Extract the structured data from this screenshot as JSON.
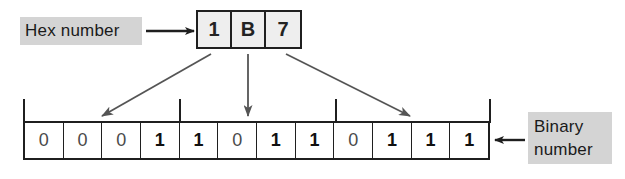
{
  "diagram": {
    "hex_label": "Hex number",
    "binary_label_line1": "Binary",
    "binary_label_line2": "number",
    "hex_digits": [
      "1",
      "B",
      "7"
    ],
    "binary_bits": [
      "0",
      "0",
      "0",
      "1",
      "1",
      "0",
      "1",
      "1",
      "0",
      "1",
      "1",
      "1"
    ],
    "nibble_groups": [
      {
        "hex": "1",
        "bits": [
          "0",
          "0",
          "0",
          "1"
        ]
      },
      {
        "hex": "B",
        "bits": [
          "1",
          "0",
          "1",
          "1"
        ]
      },
      {
        "hex": "7",
        "bits": [
          "0",
          "1",
          "1",
          "1"
        ]
      }
    ],
    "arrows": [
      {
        "name": "hex-label-to-hex-box",
        "direction": "right"
      },
      {
        "name": "hex-1-to-nibble-1",
        "direction": "down-left"
      },
      {
        "name": "hex-b-to-nibble-2",
        "direction": "down"
      },
      {
        "name": "hex-7-to-nibble-3",
        "direction": "down-right"
      },
      {
        "name": "binary-label-to-binary-row",
        "direction": "left"
      }
    ],
    "colors": {
      "label_highlight": "#d4d4d4",
      "hex_cell_fill": "#eeeeee",
      "cell_fill": "#ffffff",
      "stroke": "#1f1f1f",
      "arrow_stroke": "#555555",
      "background": "#ffffff"
    }
  }
}
